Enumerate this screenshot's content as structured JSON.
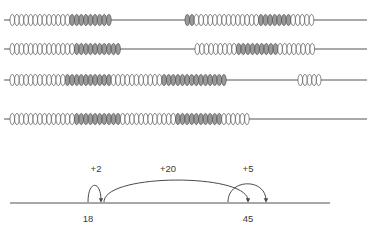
{
  "worksheet": {
    "title": "Rekenrek bead strings and number line jumps",
    "abacus": {
      "bead_colors": {
        "white": "#ffffff",
        "gray": "#9a9a9a",
        "outline": "#4a4a4a"
      },
      "rod_color": "#555555",
      "rows": [
        {
          "name": "row-1",
          "rod_y": 20,
          "rod_x1": 4,
          "rod_x2": 367,
          "groups": [
            {
              "start_x": 10,
              "bead_w": 4.6,
              "beads": [
                "white",
                "white",
                "white",
                "white",
                "white",
                "white",
                "white",
                "white",
                "white",
                "white",
                "white",
                "white",
                "white",
                "gray",
                "gray",
                "gray",
                "gray",
                "gray",
                "gray",
                "gray",
                "gray",
                "gray"
              ]
            },
            {
              "start_x": 185,
              "bead_w": 4.6,
              "beads": [
                "gray",
                "gray",
                "white",
                "white",
                "white",
                "white",
                "white",
                "white",
                "white",
                "white",
                "white",
                "white",
                "white",
                "white",
                "white",
                "white",
                "gray",
                "gray",
                "gray",
                "gray",
                "gray",
                "gray",
                "gray",
                "white",
                "white",
                "white",
                "white",
                "white"
              ]
            }
          ]
        },
        {
          "name": "row-2",
          "rod_y": 49,
          "rod_x1": 4,
          "rod_x2": 367,
          "groups": [
            {
              "start_x": 10,
              "bead_w": 4.6,
              "beads": [
                "white",
                "white",
                "white",
                "white",
                "white",
                "white",
                "white",
                "white",
                "white",
                "white",
                "white",
                "white",
                "white",
                "white",
                "gray",
                "gray",
                "gray",
                "gray",
                "gray",
                "gray",
                "gray",
                "gray",
                "gray",
                "gray"
              ]
            },
            {
              "start_x": 195,
              "bead_w": 4.6,
              "beads": [
                "white",
                "white",
                "white",
                "white",
                "white",
                "white",
                "white",
                "white",
                "white",
                "gray",
                "gray",
                "gray",
                "gray",
                "gray",
                "gray",
                "gray",
                "gray",
                "gray",
                "white",
                "white",
                "white",
                "white",
                "white",
                "white",
                "white",
                "white"
              ]
            }
          ]
        },
        {
          "name": "row-3",
          "rod_y": 80,
          "rod_x1": 4,
          "rod_x2": 367,
          "groups": [
            {
              "start_x": 10,
              "bead_w": 4.6,
              "beads": [
                "white",
                "white",
                "white",
                "white",
                "white",
                "white",
                "white",
                "white",
                "white",
                "white",
                "white",
                "white",
                "gray",
                "gray",
                "gray",
                "gray",
                "gray",
                "gray",
                "gray",
                "gray",
                "gray",
                "gray",
                "white",
                "white",
                "white",
                "white",
                "white",
                "white",
                "white",
                "white",
                "white",
                "white",
                "white",
                "gray",
                "gray",
                "gray",
                "gray",
                "gray",
                "gray",
                "gray",
                "gray",
                "gray",
                "gray",
                "gray",
                "gray",
                "gray",
                "gray"
              ]
            },
            {
              "start_x": 298,
              "bead_w": 4.6,
              "beads": [
                "white",
                "white",
                "white",
                "white",
                "white"
              ]
            }
          ]
        },
        {
          "name": "row-4",
          "rod_y": 119,
          "rod_x1": 4,
          "rod_x2": 367,
          "groups": [
            {
              "start_x": 10,
              "bead_w": 4.6,
              "beads": [
                "white",
                "white",
                "white",
                "white",
                "white",
                "white",
                "white",
                "white",
                "white",
                "white",
                "white",
                "white",
                "white",
                "white",
                "gray",
                "gray",
                "gray",
                "gray",
                "gray",
                "gray",
                "gray",
                "gray",
                "gray",
                "gray",
                "white",
                "white",
                "white",
                "white",
                "white",
                "white",
                "white",
                "white",
                "white",
                "white",
                "white",
                "white",
                "gray",
                "gray",
                "gray",
                "gray",
                "gray",
                "gray",
                "gray",
                "gray",
                "gray",
                "gray",
                "white",
                "white",
                "white",
                "white",
                "white",
                "white"
              ]
            }
          ]
        }
      ]
    },
    "numberline": {
      "line_color": "#8a8a8a",
      "arc_color": "#4a4a4a",
      "axis_y": 53,
      "axis_x1": 10,
      "axis_x2": 330,
      "jumps": [
        {
          "name": "jump-plus-2",
          "label": "+2",
          "label_x": 96,
          "label_y": 22,
          "from_x": 88,
          "to_x": 101,
          "peak_y": 30
        },
        {
          "name": "jump-plus-20",
          "label": "+20",
          "label_x": 168,
          "label_y": 22,
          "from_x": 104,
          "to_x": 248,
          "peak_y": 23
        },
        {
          "name": "jump-plus-5",
          "label": "+5",
          "label_x": 248,
          "label_y": 22,
          "from_x": 228,
          "to_x": 266,
          "peak_y": 28
        }
      ],
      "ticks": [
        {
          "name": "tick-label-18",
          "label": "18",
          "x": 88,
          "y": 72
        },
        {
          "name": "tick-label-45",
          "label": "45",
          "x": 248,
          "y": 72
        }
      ]
    }
  }
}
